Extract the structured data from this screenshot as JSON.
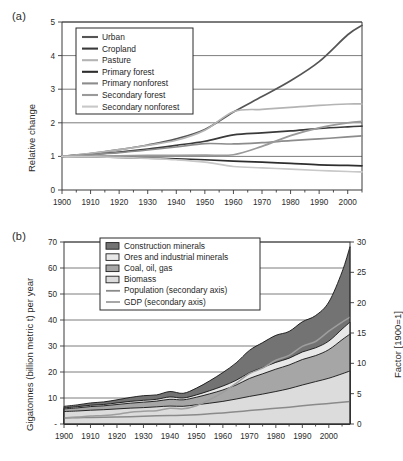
{
  "figure": {
    "panel_a_label": "(a)",
    "panel_b_label": "(b)"
  },
  "chart_data": [
    {
      "id": "panel_a",
      "type": "line",
      "title": "",
      "xlabel": "",
      "ylabel": "Relative change",
      "xlim": [
        1900,
        2005
      ],
      "ylim": [
        0,
        5
      ],
      "yticks": [
        0,
        1,
        2,
        3,
        4,
        5
      ],
      "xticks": [
        1900,
        1910,
        1920,
        1930,
        1940,
        1950,
        1960,
        1970,
        1980,
        1990,
        2000
      ],
      "grid": true,
      "legend_position": "upper-left",
      "x": [
        1900,
        1910,
        1920,
        1930,
        1940,
        1950,
        1960,
        1970,
        1980,
        1990,
        2000,
        2005
      ],
      "series": [
        {
          "name": "Urban",
          "color": "#555555",
          "width": 1.9,
          "values": [
            1.0,
            1.08,
            1.2,
            1.34,
            1.52,
            1.8,
            2.32,
            2.78,
            3.25,
            3.82,
            4.62,
            4.9
          ]
        },
        {
          "name": "Cropland",
          "color": "#3a3a3a",
          "width": 1.9,
          "values": [
            1.0,
            1.06,
            1.13,
            1.22,
            1.33,
            1.45,
            1.64,
            1.7,
            1.76,
            1.83,
            1.88,
            1.9
          ]
        },
        {
          "name": "Pasture",
          "color": "#b4b4b4",
          "width": 1.9,
          "values": [
            1.0,
            1.09,
            1.2,
            1.33,
            1.48,
            1.78,
            2.33,
            2.4,
            2.46,
            2.52,
            2.56,
            2.56
          ]
        },
        {
          "name": "Primary forest",
          "color": "#2e2e2e",
          "width": 1.9,
          "values": [
            1.0,
            0.99,
            0.97,
            0.95,
            0.93,
            0.9,
            0.86,
            0.83,
            0.79,
            0.75,
            0.73,
            0.72
          ]
        },
        {
          "name": "Primary nonforest",
          "color": "#8c8c8c",
          "width": 1.9,
          "values": [
            1.0,
            1.05,
            1.11,
            1.19,
            1.28,
            1.38,
            1.37,
            1.41,
            1.47,
            1.52,
            1.58,
            1.61
          ]
        },
        {
          "name": "Secondary forest",
          "color": "#9a9a9a",
          "width": 1.9,
          "values": [
            1.0,
            1.01,
            1.02,
            1.03,
            1.03,
            1.04,
            1.05,
            1.3,
            1.62,
            1.85,
            2.0,
            2.04
          ]
        },
        {
          "name": "Secondary nonforest",
          "color": "#c8c8c8",
          "width": 1.9,
          "values": [
            1.0,
            0.99,
            0.97,
            0.94,
            0.9,
            0.83,
            0.7,
            0.66,
            0.62,
            0.58,
            0.55,
            0.54
          ]
        }
      ]
    },
    {
      "id": "panel_b",
      "type": "area",
      "title": "",
      "xlabel": "",
      "ylabel": "Gigatonnes (billion metric t) per year",
      "ylabel_secondary": "Factor [1900=1]",
      "xlim": [
        1900,
        2008
      ],
      "ylim": [
        0,
        70
      ],
      "ylim_secondary": [
        0,
        30
      ],
      "yticks": [
        0,
        10,
        20,
        30,
        40,
        50,
        60,
        70
      ],
      "ytick_labels": [
        "-",
        "10",
        "20",
        "30",
        "40",
        "50",
        "60",
        "70"
      ],
      "yticks_secondary": [
        0,
        5,
        10,
        15,
        20,
        25,
        30
      ],
      "xticks": [
        1900,
        1910,
        1920,
        1930,
        1940,
        1950,
        1960,
        1970,
        1980,
        1990,
        2000
      ],
      "grid": true,
      "stacked": true,
      "legend_position": "upper-center",
      "x": [
        1900,
        1905,
        1910,
        1915,
        1920,
        1925,
        1930,
        1935,
        1940,
        1945,
        1950,
        1955,
        1960,
        1965,
        1970,
        1975,
        1980,
        1985,
        1990,
        1995,
        2000,
        2005,
        2008
      ],
      "series": [
        {
          "name": "Biomass",
          "color": "#dcdcdc",
          "values": [
            4.8,
            5.0,
            5.3,
            5.5,
            5.8,
            6.1,
            6.3,
            6.6,
            6.9,
            6.8,
            7.4,
            8.0,
            8.7,
            9.6,
            10.6,
            11.5,
            12.5,
            13.6,
            15.0,
            16.3,
            17.6,
            19.3,
            20.4
          ]
        },
        {
          "name": "Coal, oil, gas",
          "color": "#a6a6a6",
          "values": [
            1.0,
            1.2,
            1.4,
            1.5,
            1.7,
            1.9,
            2.1,
            2.2,
            2.6,
            2.5,
            2.9,
            3.6,
            4.4,
            5.4,
            6.9,
            7.8,
            8.6,
            9.1,
            9.8,
            10.0,
            11.0,
            13.1,
            14.2
          ]
        },
        {
          "name": "Ores and industrial minerals",
          "color": "#e8e8e8",
          "values": [
            0.4,
            0.45,
            0.5,
            0.5,
            0.6,
            0.7,
            0.7,
            0.7,
            0.9,
            0.7,
            0.9,
            1.2,
            1.5,
            1.8,
            2.2,
            2.4,
            2.6,
            2.6,
            2.9,
            3.0,
            3.3,
            4.1,
            4.6
          ]
        },
        {
          "name": "Construction minerals",
          "color": "#737373",
          "values": [
            0.6,
            0.7,
            0.9,
            1.0,
            1.2,
            1.5,
            1.8,
            1.7,
            2.1,
            1.8,
            2.6,
            3.8,
            5.2,
            6.7,
            8.6,
            9.6,
            10.4,
            10.3,
            11.6,
            12.4,
            15.0,
            22.0,
            29.0
          ]
        }
      ],
      "overlay_series": [
        {
          "name": "Population (secondary axis)",
          "color": "#8a8a8a",
          "axis": "secondary",
          "values": [
            1.0,
            1.04,
            1.09,
            1.12,
            1.15,
            1.21,
            1.28,
            1.34,
            1.4,
            1.44,
            1.53,
            1.67,
            1.83,
            2.01,
            2.21,
            2.4,
            2.58,
            2.78,
            3.0,
            3.2,
            3.39,
            3.59,
            3.72
          ]
        },
        {
          "name": "GDP (secondary axis)",
          "color": "#9e9e9e",
          "axis": "secondary",
          "values": [
            1.0,
            1.15,
            1.3,
            1.4,
            1.6,
            1.95,
            2.1,
            2.2,
            2.6,
            2.5,
            3.0,
            4.0,
            5.2,
            6.7,
            8.3,
            9.2,
            10.5,
            11.3,
            12.8,
            13.6,
            15.3,
            16.8,
            17.6
          ]
        }
      ]
    }
  ]
}
